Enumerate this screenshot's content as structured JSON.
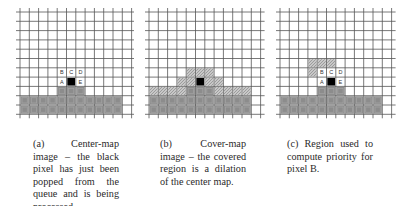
{
  "figure": {
    "grid": {
      "cols": 12,
      "rows": 11
    },
    "colors": {
      "line": "#555555",
      "filled": "#8c8c8c",
      "filled_inner": "#a2a2a2",
      "hatched": "#c8c8c8",
      "black": "#000000"
    },
    "panels": [
      {
        "id": "a",
        "caption": "(a) Center-map image – the black pixel has just been popped from the queue and is being processed.",
        "black": [
          5,
          7
        ],
        "filled": [
          [
            4,
            8
          ],
          [
            5,
            8
          ],
          [
            6,
            8
          ],
          [
            0,
            9
          ],
          [
            1,
            9
          ],
          [
            2,
            9
          ],
          [
            3,
            9
          ],
          [
            4,
            9
          ],
          [
            5,
            9
          ],
          [
            6,
            9
          ],
          [
            7,
            9
          ],
          [
            8,
            9
          ],
          [
            9,
            9
          ],
          [
            10,
            9
          ],
          [
            0,
            10
          ],
          [
            1,
            10
          ],
          [
            2,
            10
          ],
          [
            3,
            10
          ],
          [
            4,
            10
          ],
          [
            5,
            10
          ],
          [
            6,
            10
          ],
          [
            7,
            10
          ],
          [
            8,
            10
          ],
          [
            9,
            10
          ],
          [
            10,
            10
          ]
        ],
        "hatched": [],
        "labels": [
          {
            "text": "B",
            "cell": [
              4,
              6
            ]
          },
          {
            "text": "C",
            "cell": [
              5,
              6
            ]
          },
          {
            "text": "D",
            "cell": [
              6,
              6
            ]
          },
          {
            "text": "A",
            "cell": [
              4,
              7
            ]
          },
          {
            "text": "E",
            "cell": [
              6,
              7
            ]
          }
        ]
      },
      {
        "id": "b",
        "caption": "(b) Cover-map image – the covered region is a dilation of the center map.",
        "black": [
          5,
          7
        ],
        "filled": [
          [
            4,
            8
          ],
          [
            5,
            8
          ],
          [
            6,
            8
          ],
          [
            0,
            9
          ],
          [
            1,
            9
          ],
          [
            2,
            9
          ],
          [
            3,
            9
          ],
          [
            4,
            9
          ],
          [
            5,
            9
          ],
          [
            6,
            9
          ],
          [
            7,
            9
          ],
          [
            8,
            9
          ],
          [
            9,
            9
          ],
          [
            10,
            9
          ],
          [
            0,
            10
          ],
          [
            1,
            10
          ],
          [
            2,
            10
          ],
          [
            3,
            10
          ],
          [
            4,
            10
          ],
          [
            5,
            10
          ],
          [
            6,
            10
          ],
          [
            7,
            10
          ],
          [
            8,
            10
          ],
          [
            9,
            10
          ],
          [
            10,
            10
          ]
        ],
        "hatched": [
          [
            4,
            6
          ],
          [
            5,
            6
          ],
          [
            6,
            6
          ],
          [
            3,
            7
          ],
          [
            4,
            7
          ],
          [
            6,
            7
          ],
          [
            7,
            7
          ],
          [
            0,
            8
          ],
          [
            1,
            8
          ],
          [
            2,
            8
          ],
          [
            3,
            8
          ],
          [
            7,
            8
          ],
          [
            8,
            8
          ],
          [
            9,
            8
          ],
          [
            10,
            8
          ]
        ],
        "labels": []
      },
      {
        "id": "c",
        "caption": "(c) Region used to compute priority for pixel B.",
        "black": [
          5,
          7
        ],
        "filled": [
          [
            4,
            8
          ],
          [
            5,
            8
          ],
          [
            6,
            8
          ],
          [
            0,
            9
          ],
          [
            1,
            9
          ],
          [
            2,
            9
          ],
          [
            3,
            9
          ],
          [
            4,
            9
          ],
          [
            5,
            9
          ],
          [
            6,
            9
          ],
          [
            7,
            9
          ],
          [
            8,
            9
          ],
          [
            9,
            9
          ],
          [
            10,
            9
          ],
          [
            0,
            10
          ],
          [
            1,
            10
          ],
          [
            2,
            10
          ],
          [
            3,
            10
          ],
          [
            4,
            10
          ],
          [
            5,
            10
          ],
          [
            6,
            10
          ],
          [
            7,
            10
          ],
          [
            8,
            10
          ],
          [
            9,
            10
          ],
          [
            10,
            10
          ]
        ],
        "hatched": [
          [
            3,
            5
          ],
          [
            4,
            5
          ],
          [
            5,
            5
          ],
          [
            3,
            6
          ]
        ],
        "labels": [
          {
            "text": "B",
            "cell": [
              4,
              6
            ]
          },
          {
            "text": "C",
            "cell": [
              5,
              6
            ]
          },
          {
            "text": "D",
            "cell": [
              6,
              6
            ]
          },
          {
            "text": "A",
            "cell": [
              4,
              7
            ]
          },
          {
            "text": "E",
            "cell": [
              6,
              7
            ]
          }
        ]
      }
    ]
  }
}
